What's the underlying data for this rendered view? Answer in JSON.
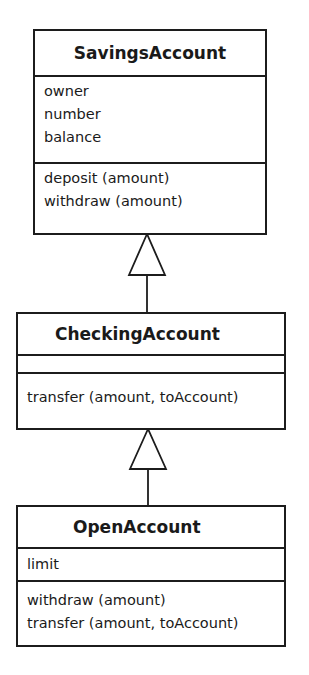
{
  "diagram": {
    "type": "UML class diagram (inheritance)",
    "classes": [
      {
        "name": "SavingsAccount",
        "attributes": [
          "owner",
          "number",
          "balance"
        ],
        "operations": [
          "deposit (amount)",
          "withdraw (amount)"
        ]
      },
      {
        "name": "CheckingAccount",
        "attributes": [],
        "operations": [
          "transfer (amount, toAccount)"
        ]
      },
      {
        "name": "OpenAccount",
        "attributes": [
          "limit"
        ],
        "operations": [
          "withdraw (amount)",
          "transfer (amount, toAccount)"
        ]
      }
    ],
    "relationships": [
      {
        "type": "generalization",
        "from": "CheckingAccount",
        "to": "SavingsAccount"
      },
      {
        "type": "generalization",
        "from": "OpenAccount",
        "to": "CheckingAccount"
      }
    ]
  }
}
